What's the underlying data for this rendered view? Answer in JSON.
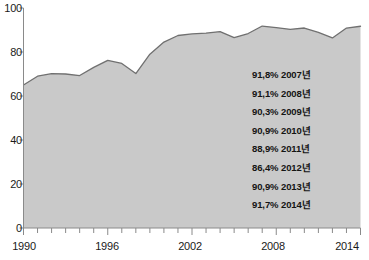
{
  "chart_data": {
    "type": "area",
    "title": "",
    "subtitle": "",
    "xlabel": "",
    "ylabel": "",
    "xlim": [
      1990,
      2014
    ],
    "ylim": [
      0,
      100
    ],
    "grid": false,
    "legend_position": "inside-right",
    "yticks": [
      "0",
      "20",
      "40",
      "60",
      "80",
      "100"
    ],
    "ytick_values": [
      0,
      20,
      40,
      60,
      80,
      100
    ],
    "xticks": [
      "1990",
      "1996",
      "2002",
      "2008",
      "2014"
    ],
    "xtick_values": [
      1990,
      1996,
      2002,
      2008,
      2014
    ],
    "x": [
      1990,
      1991,
      1992,
      1993,
      1994,
      1995,
      1996,
      1997,
      1998,
      1999,
      2000,
      2001,
      2002,
      2003,
      2004,
      2005,
      2006,
      2007,
      2008,
      2009,
      2010,
      2011,
      2012,
      2013,
      2014
    ],
    "values": [
      65.0,
      69.0,
      70.2,
      70.0,
      69.3,
      73.0,
      76.2,
      74.8,
      70.2,
      79.0,
      84.5,
      87.5,
      88.2,
      88.6,
      89.3,
      86.5,
      88.4,
      91.8,
      91.1,
      90.3,
      90.9,
      88.9,
      86.4,
      90.9,
      91.7
    ],
    "series": [
      {
        "name": "",
        "values": [
          65.0,
          69.0,
          70.2,
          70.0,
          69.3,
          73.0,
          76.2,
          74.8,
          70.2,
          79.0,
          84.5,
          87.5,
          88.2,
          88.6,
          89.3,
          86.5,
          88.4,
          91.8,
          91.1,
          90.3,
          90.9,
          88.9,
          86.4,
          90.9,
          91.7
        ],
        "fill_color": "#c9c9c9",
        "line_color": "#707070"
      }
    ],
    "annotations": [
      {
        "percent": "91,8%",
        "year": "2007년"
      },
      {
        "percent": "91,1%",
        "year": "2008년"
      },
      {
        "percent": "90,3%",
        "year": "2009년"
      },
      {
        "percent": "90,9%",
        "year": "2010년"
      },
      {
        "percent": "88,9%",
        "year": "2011년"
      },
      {
        "percent": "86,4%",
        "year": "2012년"
      },
      {
        "percent": "90,9%",
        "year": "2013년"
      },
      {
        "percent": "91,7%",
        "year": "2014년"
      }
    ]
  },
  "axes": {
    "y_labels": [
      "100",
      "80",
      "60",
      "40",
      "20",
      "0"
    ],
    "x_labels": [
      "1990",
      "1996",
      "2002",
      "2008",
      "2014"
    ]
  },
  "colors": {
    "area_fill": "#c9c9c9",
    "area_line": "#707070",
    "axis": "#8a8a8a",
    "text": "#1a1a1a",
    "background": "#ffffff"
  }
}
